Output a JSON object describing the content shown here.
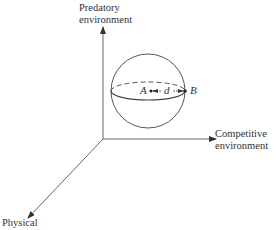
{
  "diagram": {
    "axes": {
      "vertical": {
        "label_line1": "Predatory",
        "label_line2": "environment"
      },
      "horizontal": {
        "label_line1": "Competitive",
        "label_line2": "environment"
      },
      "diagonal": {
        "label": "Physical"
      }
    },
    "sphere": {
      "point_a": "A",
      "point_b": "B",
      "distance": "d"
    },
    "colors": {
      "line": "#555555",
      "background": "#ffffff"
    }
  }
}
